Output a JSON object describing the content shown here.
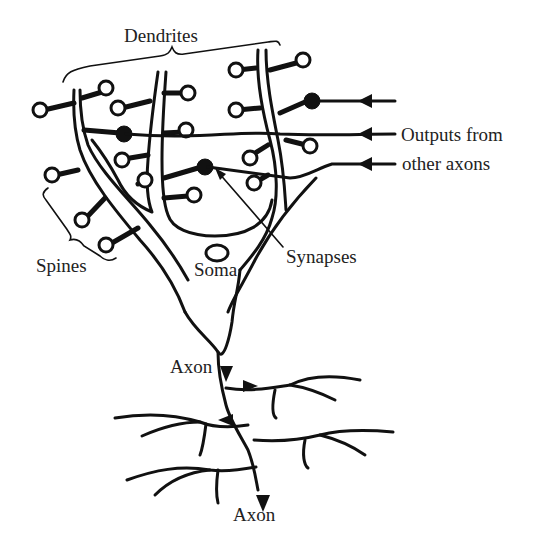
{
  "diagram": {
    "type": "neuron-anatomy",
    "labels": {
      "dendrites": "Dendrites",
      "outputs_line1": "Outputs from",
      "outputs_line2": "other axons",
      "spines": "Spines",
      "synapses": "Synapses",
      "soma": "Soma",
      "axon_upper": "Axon",
      "axon_lower": "Axon"
    },
    "colors": {
      "ink": "#111111",
      "text": "#222222",
      "background": "#ffffff"
    },
    "input_arrow_count": 3,
    "synapse_count": 3
  }
}
